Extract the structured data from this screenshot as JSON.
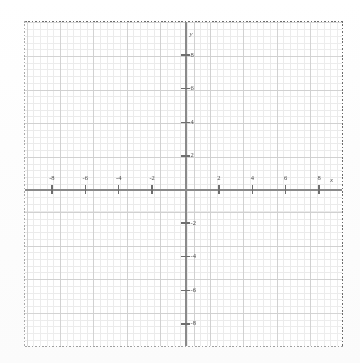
{
  "chart_data": {
    "type": "scatter",
    "title": "",
    "subtitle": "",
    "xlabel": "x",
    "ylabel": "y",
    "xlim": [
      -9.5,
      9.5
    ],
    "ylim": [
      -9.6,
      9.8
    ],
    "xticks": [
      -8,
      -6,
      -4,
      -2,
      2,
      4,
      6,
      8
    ],
    "yticks": [
      8,
      6,
      4,
      2,
      -2,
      -4,
      -6,
      -8
    ],
    "xticklabels": [
      "-8",
      "-6",
      "-4",
      "-2",
      "2",
      "4",
      "6",
      "8"
    ],
    "yticklabels": [
      "8",
      "6",
      "4",
      "2",
      "-2",
      "-4",
      "-6",
      "-8"
    ],
    "major_tick_step": 2,
    "minor_subdivisions": 5,
    "grid": true,
    "minor_grid": true,
    "legend": null,
    "series": [],
    "x": [],
    "values": [],
    "annotations": [],
    "origin_label": ""
  },
  "figure": {
    "axis_label_x": "x",
    "axis_label_y": "y",
    "border_style": "dashed",
    "background_color": "#ffffff",
    "major_grid_color": "#cfcfcf",
    "minor_grid_color": "#e8e8e8",
    "axis_color": "#8a8a8a",
    "tick_color": "#6e6e6e",
    "label_color": "#4a4a4a",
    "border_color": "#6d6d6d"
  }
}
